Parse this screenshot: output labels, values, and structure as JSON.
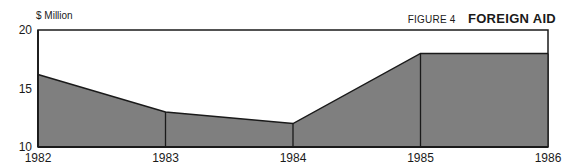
{
  "figure": {
    "number_label": "FIGURE 4",
    "title": "FOREIGN AID",
    "unit_label": "$ Million"
  },
  "colors": {
    "fill": "#7f7f7f",
    "line": "#1a1a1a",
    "background": "#ffffff"
  },
  "chart_data": {
    "type": "area",
    "title": "FOREIGN AID",
    "subtitle": "FIGURE 4",
    "xlabel": "",
    "ylabel": "$ Million",
    "x": [
      "1982",
      "1983",
      "1984",
      "1985",
      "1986"
    ],
    "series": [
      {
        "name": "Foreign Aid",
        "values": [
          16.2,
          13.0,
          12.0,
          18.0,
          18.0
        ]
      }
    ],
    "ylim": [
      10,
      20
    ],
    "yticks": [
      10,
      15,
      20
    ],
    "grid": false,
    "legend": "none",
    "annotations": []
  }
}
